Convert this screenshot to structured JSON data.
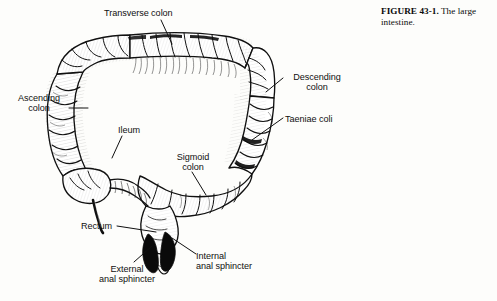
{
  "figure": {
    "number_label": "FIGURE 43-1.",
    "caption_text": " The large intestine."
  },
  "labels": {
    "transverse_colon": "Transverse colon",
    "descending_colon": "Descending\ncolon",
    "taeniae_coli": "Taeniae coli",
    "ascending_colon": "Ascending\ncolon",
    "ileum": "Ileum",
    "sigmoid_colon": "Sigmoid\ncolon",
    "rectum": "Rectum",
    "external_anal_sphincter": "External\nanal sphincter",
    "internal_anal_sphincter": "Internal\nanal sphincter"
  },
  "colors": {
    "ink": "#101010",
    "page_background": "#fdfdfb",
    "taenia_band": "#0d0d0d",
    "sphincter_fill": "#0a0a0a",
    "hatch_stroke": "#1a1a1a"
  },
  "diagram": {
    "type": "line-drawing",
    "parts": [
      "ascending-colon",
      "transverse-colon",
      "descending-colon",
      "sigmoid-colon",
      "cecum",
      "vermiform-appendix",
      "ileum",
      "rectum",
      "internal-anal-sphincter",
      "external-anal-sphincter",
      "taeniae-coli",
      "haustra"
    ]
  }
}
